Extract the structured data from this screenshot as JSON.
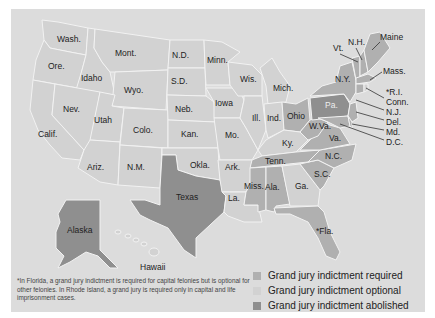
{
  "colors": {
    "background": "#dcdcdc",
    "required": "#b0b0b0",
    "optional": "#d2d2d2",
    "abolished": "#8f8f8f",
    "border": "#f2f2f2",
    "leader": "#333333"
  },
  "legend": [
    {
      "key": "required",
      "label": "Grand jury indictment required"
    },
    {
      "key": "optional",
      "label": "Grand jury indictment optional"
    },
    {
      "key": "abolished",
      "label": "Grand jury indictment abolished"
    }
  ],
  "footnote": "*In Florida, a grand jury indictment is required for capital felonies but is optional for other felonies. In Rhode Island, a grand jury is required only in capital and life imprisonment cases.",
  "states": {
    "wash": "Wash.",
    "ore": "Ore.",
    "calif": "Calif.",
    "idaho": "Idaho",
    "nev": "Nev.",
    "mont": "Mont.",
    "wyo": "Wyo.",
    "utah": "Utah",
    "ariz": "Ariz.",
    "colo": "Colo.",
    "nm": "N.M.",
    "nd": "N.D.",
    "sd": "S.D.",
    "neb": "Neb.",
    "kan": "Kan.",
    "okla": "Okla.",
    "texas": "Texas",
    "minn": "Minn.",
    "iowa": "Iowa",
    "mo": "Mo.",
    "ark": "Ark.",
    "la": "La.",
    "wis": "Wis.",
    "ill": "Ill.",
    "mich": "Mich.",
    "ind": "Ind.",
    "ohio": "Ohio",
    "ky": "Ky.",
    "tenn": "Tenn.",
    "miss": "Miss.",
    "ala": "Ala.",
    "ga": "Ga.",
    "fla": "*Fla.",
    "sc": "S.C.",
    "nc": "N.C.",
    "va": "Va.",
    "wva": "W.Va.",
    "pa": "Pa.",
    "ny": "N.Y.",
    "vt": "Vt.",
    "nh": "N.H.",
    "maine": "Maine",
    "mass": "Mass.",
    "ri": "*R.I.",
    "conn": "Conn.",
    "nj": "N.J.",
    "del": "Del.",
    "md": "Md.",
    "dc": "D.C.",
    "alaska": "Alaska",
    "hawaii": "Hawaii"
  }
}
